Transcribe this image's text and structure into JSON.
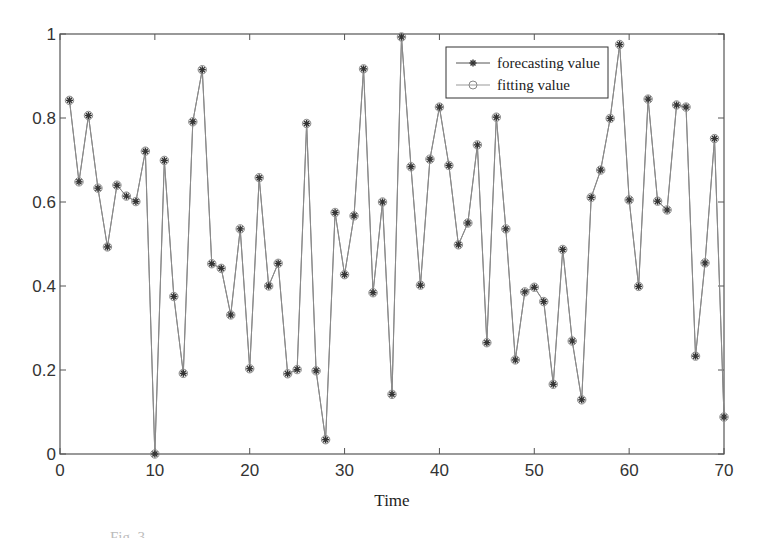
{
  "chart_data": {
    "type": "line",
    "title": "",
    "xlabel": "Time",
    "ylabel": "",
    "xlim": [
      0,
      70
    ],
    "ylim": [
      0,
      1
    ],
    "xticks": [
      0,
      10,
      20,
      30,
      40,
      50,
      60,
      70
    ],
    "yticks": [
      0,
      0.2,
      0.4,
      0.6,
      0.8,
      1
    ],
    "xtick_labels": [
      "0",
      "10",
      "20",
      "30",
      "40",
      "50",
      "60",
      "70"
    ],
    "ytick_labels": [
      "0",
      "0.2",
      "0.4",
      "0.6",
      "0.8",
      "1"
    ],
    "grid": false,
    "legend_position": "upper right",
    "x": [
      1,
      2,
      3,
      4,
      5,
      6,
      7,
      8,
      9,
      10,
      11,
      12,
      13,
      14,
      15,
      16,
      17,
      18,
      19,
      20,
      21,
      22,
      23,
      24,
      25,
      26,
      27,
      28,
      29,
      30,
      31,
      32,
      33,
      34,
      35,
      36,
      37,
      38,
      39,
      40,
      41,
      42,
      43,
      44,
      45,
      46,
      47,
      48,
      49,
      50,
      51,
      52,
      53,
      54,
      55,
      56,
      57,
      58,
      59,
      60,
      61,
      62,
      63,
      64,
      65,
      66,
      67,
      68,
      69,
      70
    ],
    "series": [
      {
        "name": "forecasting value",
        "marker": "asterisk",
        "color": "#444444",
        "values": [
          0.842,
          0.648,
          0.806,
          0.633,
          0.493,
          0.64,
          0.614,
          0.601,
          0.721,
          0.0,
          0.699,
          0.375,
          0.192,
          0.791,
          0.915,
          0.453,
          0.442,
          0.331,
          0.536,
          0.203,
          0.658,
          0.4,
          0.454,
          0.191,
          0.201,
          0.787,
          0.198,
          0.034,
          0.575,
          0.427,
          0.567,
          0.917,
          0.384,
          0.6,
          0.142,
          0.993,
          0.684,
          0.402,
          0.702,
          0.826,
          0.687,
          0.498,
          0.55,
          0.736,
          0.265,
          0.802,
          0.536,
          0.224,
          0.386,
          0.397,
          0.363,
          0.166,
          0.487,
          0.269,
          0.129,
          0.611,
          0.676,
          0.799,
          0.975,
          0.605,
          0.399,
          0.845,
          0.602,
          0.581,
          0.831,
          0.826,
          0.233,
          0.455,
          0.751,
          0.088
        ]
      },
      {
        "name": "fitting value",
        "marker": "circle",
        "color": "#999999",
        "values": [
          0.842,
          0.648,
          0.806,
          0.633,
          0.493,
          0.64,
          0.614,
          0.601,
          0.721,
          0.0,
          0.699,
          0.375,
          0.192,
          0.791,
          0.915,
          0.453,
          0.442,
          0.331,
          0.536,
          0.203,
          0.658,
          0.4,
          0.454,
          0.191,
          0.201,
          0.787,
          0.198,
          0.034,
          0.575,
          0.427,
          0.567,
          0.917,
          0.384,
          0.6,
          0.142,
          0.993,
          0.684,
          0.402,
          0.702,
          0.826,
          0.687,
          0.498,
          0.55,
          0.736,
          0.265,
          0.802,
          0.536,
          0.224,
          0.386,
          0.397,
          0.363,
          0.166,
          0.487,
          0.269,
          0.129,
          0.611,
          0.676,
          0.799,
          0.975,
          0.605,
          0.399,
          0.845,
          0.602,
          0.581,
          0.831,
          0.826,
          0.233,
          0.455,
          0.751,
          0.088
        ]
      }
    ]
  },
  "legend": {
    "items": [
      {
        "label": "forecasting value"
      },
      {
        "label": "fitting value"
      }
    ]
  },
  "axes": {
    "xlabel": "Time"
  },
  "caption": {
    "text": "Fig. 3"
  }
}
